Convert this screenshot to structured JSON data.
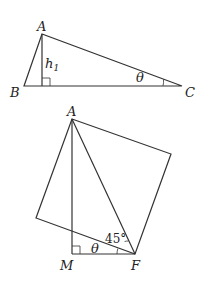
{
  "figure1": {
    "vertices": {
      "A": "A",
      "B": "B",
      "C": "C"
    },
    "altitude_label": "h",
    "altitude_subscript": "1",
    "angle_label": "θ"
  },
  "figure2": {
    "vertices": {
      "A": "A",
      "M": "M",
      "F": "F"
    },
    "angle_theta": "θ",
    "angle_45": "45°"
  },
  "colors": {
    "stroke": "#333333",
    "background": "#ffffff"
  }
}
